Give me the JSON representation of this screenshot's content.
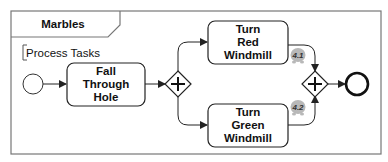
{
  "diagram": {
    "type": "bpmn-process",
    "frame": {
      "title": "Marbles"
    },
    "annotation": {
      "text": "Process Tasks"
    },
    "nodes": {
      "start_event": {
        "kind": "start-event"
      },
      "task_fall": {
        "kind": "task",
        "lines": [
          "Fall",
          "Through",
          "Hole"
        ]
      },
      "split_gateway": {
        "kind": "parallel-gateway",
        "symbol": "+"
      },
      "task_red": {
        "kind": "task",
        "lines": [
          "Turn",
          "Red",
          "Windmill"
        ]
      },
      "task_green": {
        "kind": "task",
        "lines": [
          "Turn",
          "Green",
          "Windmill"
        ]
      },
      "join_gateway": {
        "kind": "parallel-gateway",
        "symbol": "+"
      },
      "end_event": {
        "kind": "end-event"
      }
    },
    "tokens": [
      {
        "label": "4.1",
        "color": "#b8b8b8"
      },
      {
        "label": "4.2",
        "color": "#b8b8b8"
      }
    ],
    "edges": [
      {
        "from": "start_event",
        "to": "task_fall"
      },
      {
        "from": "task_fall",
        "to": "split_gateway"
      },
      {
        "from": "split_gateway",
        "to": "task_red"
      },
      {
        "from": "split_gateway",
        "to": "task_green"
      },
      {
        "from": "task_red",
        "to": "join_gateway"
      },
      {
        "from": "task_green",
        "to": "join_gateway"
      },
      {
        "from": "join_gateway",
        "to": "end_event"
      }
    ],
    "colors": {
      "stroke": "#222222",
      "frame": "#777777",
      "token": "#b8b8b8",
      "background": "#ffffff"
    }
  }
}
